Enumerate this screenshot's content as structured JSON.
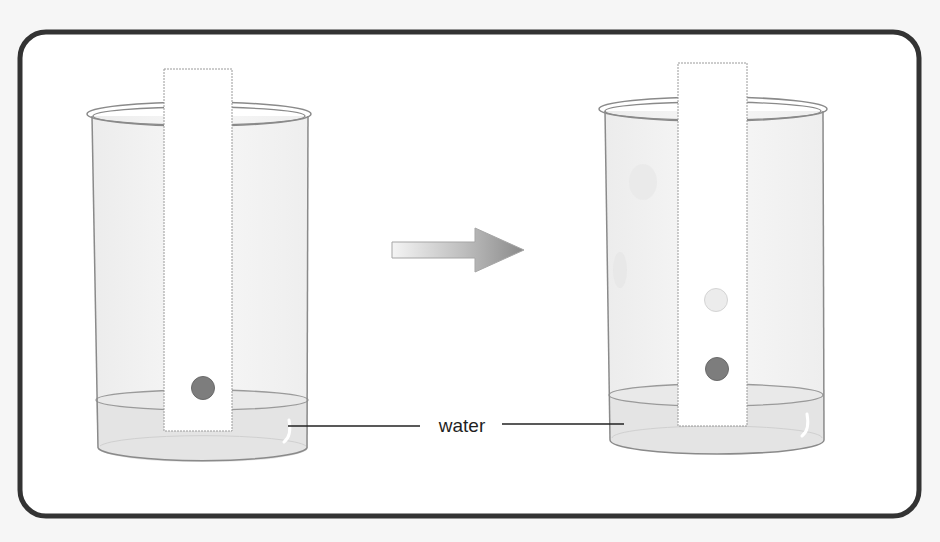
{
  "diagram": {
    "type": "paper chromatography before/after",
    "label": "water",
    "frame": {
      "border_color": "#333333",
      "background": "#ffffff"
    },
    "colors": {
      "beaker_outline": "#8a8a8a",
      "beaker_fill": "#f2f2f2",
      "water_fill": "#e6e6e6",
      "strip_fill": "#ffffff",
      "strip_outline": "#9a9a9a",
      "dot_dark": "#7d7d7d",
      "dot_light": "#ececec",
      "arrow_dark": "#8c8c8c",
      "arrow_light": "#f2f2f2"
    },
    "panels": [
      {
        "name": "before",
        "dots": [
          {
            "shade": "dark"
          }
        ]
      },
      {
        "name": "after",
        "dots": [
          {
            "shade": "light"
          },
          {
            "shade": "dark"
          }
        ]
      }
    ],
    "arrow": {
      "direction": "right"
    }
  }
}
